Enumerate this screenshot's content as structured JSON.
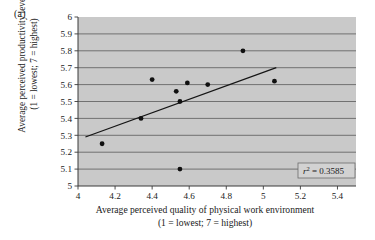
{
  "panel": {
    "label": "(a)"
  },
  "axes": {
    "y_title_line1": "Average perceived productivity level",
    "y_title_line2": "(1 = lowest; 7 = highest)",
    "x_title_line1": "Average perceived quality of physical work environment",
    "x_title_line2": "(1 = lowest; 7 = highest)",
    "x_ticks": [
      "4",
      "4.2",
      "4.4",
      "4.6",
      "4.8",
      "5",
      "5.2",
      "5.4"
    ],
    "y_ticks": [
      "5",
      "5.1",
      "5.2",
      "5.3",
      "5.4",
      "5.5",
      "5.6",
      "5.7",
      "5.8",
      "5.9",
      "6"
    ]
  },
  "annotation": {
    "r2_symbol": "r",
    "r2_exponent": "2",
    "r2_equals": " = 0.3585",
    "r2_full": "r2 = 0.3585"
  },
  "colors": {
    "plot_background": "#c9c9c9",
    "gridline": "#4a4a4a",
    "axis": "#3a3a3a",
    "point": "#101010",
    "trendline": "#151515",
    "annotation_background": "#d2d2d2",
    "annotation_border": "#6b6b6b",
    "text": "#1a1a1a",
    "page_background": "#ffffff"
  },
  "chart_data": {
    "type": "scatter",
    "title": "",
    "xlabel": "Average perceived quality of physical work environment (1 = lowest; 7 = highest)",
    "ylabel": "Average perceived productivity level (1 = lowest; 7 = highest)",
    "xlim": [
      4,
      5.5
    ],
    "ylim": [
      5,
      6
    ],
    "xtick_values": [
      4,
      4.2,
      4.4,
      4.6,
      4.8,
      5,
      5.2,
      5.4
    ],
    "ytick_values": [
      5,
      5.1,
      5.2,
      5.3,
      5.4,
      5.5,
      5.6,
      5.7,
      5.8,
      5.9,
      6
    ],
    "grid": true,
    "grid_axis": "y",
    "legend": false,
    "points": [
      {
        "x": 4.13,
        "y": 5.25
      },
      {
        "x": 4.34,
        "y": 5.4
      },
      {
        "x": 4.4,
        "y": 5.63
      },
      {
        "x": 4.53,
        "y": 5.56
      },
      {
        "x": 4.55,
        "y": 5.5
      },
      {
        "x": 4.55,
        "y": 5.1
      },
      {
        "x": 4.59,
        "y": 5.61
      },
      {
        "x": 4.7,
        "y": 5.6
      },
      {
        "x": 4.89,
        "y": 5.8
      },
      {
        "x": 5.06,
        "y": 5.62
      }
    ],
    "trendline": {
      "x_start": 4.04,
      "y_start": 5.29,
      "x_end": 5.07,
      "y_end": 5.7
    },
    "annotations": [
      {
        "text": "r2 = 0.3585",
        "x": 5.33,
        "y": 5.05
      }
    ]
  }
}
